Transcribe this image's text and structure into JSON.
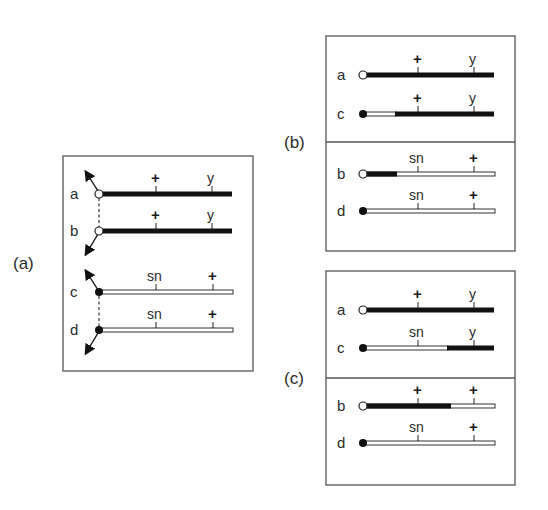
{
  "figure": {
    "panels": [
      {
        "id": "a",
        "label": "(a)",
        "description": "Two homologous chromosomes with sister chromatids; a and b (open centromere) carry + and y; c and d (filled centromere) carry sn and +",
        "chromatids": [
          {
            "name": "a",
            "loci": [
              "+",
              "y"
            ],
            "centromere": "open",
            "segments": "black"
          },
          {
            "name": "b",
            "loci": [
              "+",
              "y"
            ],
            "centromere": "open",
            "segments": "black"
          },
          {
            "name": "c",
            "loci": [
              "sn",
              "+"
            ],
            "centromere": "filled",
            "segments": "white"
          },
          {
            "name": "d",
            "loci": [
              "sn",
              "+"
            ],
            "centromere": "filled",
            "segments": "white"
          }
        ]
      },
      {
        "id": "b",
        "label": "(b)",
        "groups": [
          [
            {
              "name": "a",
              "loci": [
                "+",
                "y"
              ],
              "centromere": "open",
              "segments": "black"
            },
            {
              "name": "c",
              "loci": [
                "+",
                "y"
              ],
              "centromere": "filled",
              "segments": "white→black (crossover before first locus)"
            }
          ],
          [
            {
              "name": "b",
              "loci": [
                "sn",
                "+"
              ],
              "centromere": "open",
              "segments": "black→white (crossover before first locus)"
            },
            {
              "name": "d",
              "loci": [
                "sn",
                "+"
              ],
              "centromere": "filled",
              "segments": "white"
            }
          ]
        ]
      },
      {
        "id": "c",
        "label": "(c)",
        "groups": [
          [
            {
              "name": "a",
              "loci": [
                "+",
                "y"
              ],
              "centromere": "open",
              "segments": "black"
            },
            {
              "name": "c",
              "loci": [
                "sn",
                "y"
              ],
              "centromere": "filled",
              "segments": "white→black (crossover between loci)"
            }
          ],
          [
            {
              "name": "b",
              "loci": [
                "+",
                "+"
              ],
              "centromere": "open",
              "segments": "black→white (crossover between loci)"
            },
            {
              "name": "d",
              "loci": [
                "sn",
                "+"
              ],
              "centromere": "filled",
              "segments": "white"
            }
          ]
        ]
      }
    ]
  },
  "labels": {
    "panel_a": "(a)",
    "panel_b": "(b)",
    "panel_c": "(c)",
    "a": "a",
    "b": "b",
    "c": "c",
    "d": "d",
    "plus": "+",
    "y": "y",
    "sn": "sn"
  },
  "colors": {
    "chromatid_black": "#111111",
    "chromatid_white": "#ffffff",
    "outline": "#333333",
    "border": "#555555"
  }
}
